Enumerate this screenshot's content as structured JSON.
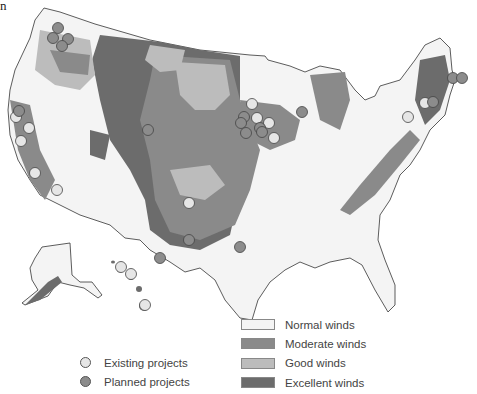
{
  "corner_text": "n",
  "colors": {
    "normal": "#f4f4f4",
    "moderate": "#8a8a8a",
    "good": "#bcbcbc",
    "excellent": "#6c6c6c",
    "existing_dot": "#e6e6e6",
    "planned_dot": "#8c8c8c",
    "border": "#333333"
  },
  "legend_projects": [
    {
      "label": "Existing projects",
      "key": "existing"
    },
    {
      "label": "Planned projects",
      "key": "planned"
    }
  ],
  "legend_winds": [
    {
      "label": "Normal winds",
      "key": "normal"
    },
    {
      "label": "Moderate winds",
      "key": "moderate"
    },
    {
      "label": "Good winds",
      "key": "good"
    },
    {
      "label": "Excellent winds",
      "key": "excellent"
    }
  ],
  "projects": {
    "existing": [
      {
        "region": "northern-california-1"
      },
      {
        "region": "northern-california-2"
      },
      {
        "region": "northern-california-3"
      },
      {
        "region": "central-california"
      },
      {
        "region": "southern-california"
      },
      {
        "region": "minnesota-1"
      },
      {
        "region": "minnesota-2"
      },
      {
        "region": "minnesota-3"
      },
      {
        "region": "iowa-1"
      },
      {
        "region": "oklahoma"
      },
      {
        "region": "new-york"
      },
      {
        "region": "vermont"
      },
      {
        "region": "hawaii-1"
      },
      {
        "region": "hawaii-2"
      },
      {
        "region": "hawaii-3"
      }
    ],
    "planned": [
      {
        "region": "washington-1"
      },
      {
        "region": "washington-2"
      },
      {
        "region": "washington-3"
      },
      {
        "region": "washington-4"
      },
      {
        "region": "oregon"
      },
      {
        "region": "wyoming"
      },
      {
        "region": "minnesota-4"
      },
      {
        "region": "minnesota-5"
      },
      {
        "region": "iowa-2"
      },
      {
        "region": "iowa-3"
      },
      {
        "region": "iowa-4"
      },
      {
        "region": "wisconsin"
      },
      {
        "region": "new-mexico"
      },
      {
        "region": "west-texas"
      },
      {
        "region": "central-texas"
      },
      {
        "region": "maine-1"
      },
      {
        "region": "maine-2"
      },
      {
        "region": "new-hampshire"
      }
    ]
  }
}
